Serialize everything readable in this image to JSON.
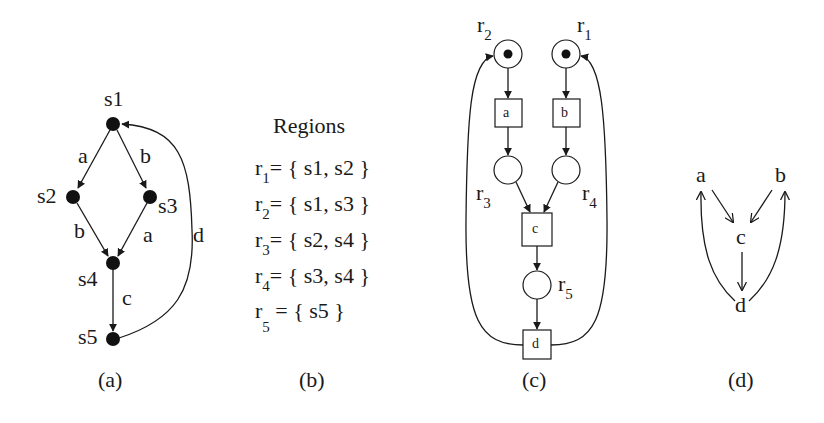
{
  "panel_a": {
    "caption": "(a)",
    "nodes": [
      {
        "id": "s1",
        "label": "s1"
      },
      {
        "id": "s2",
        "label": "s2"
      },
      {
        "id": "s3",
        "label": "s3"
      },
      {
        "id": "s4",
        "label": "s4"
      },
      {
        "id": "s5",
        "label": "s5"
      }
    ],
    "edges": [
      {
        "from": "s1",
        "to": "s2",
        "label": "a"
      },
      {
        "from": "s1",
        "to": "s3",
        "label": "b"
      },
      {
        "from": "s2",
        "to": "s4",
        "label": "b"
      },
      {
        "from": "s3",
        "to": "s4",
        "label": "a"
      },
      {
        "from": "s4",
        "to": "s5",
        "label": "c"
      },
      {
        "from": "s5",
        "to": "s1",
        "label": "d"
      }
    ]
  },
  "panel_b": {
    "caption": "(b)",
    "title": "Regions",
    "regions": [
      {
        "name": "r",
        "sub": "1",
        "set": "= { s1, s2 }"
      },
      {
        "name": "r",
        "sub": "2",
        "set": "= { s1, s3 }"
      },
      {
        "name": "r",
        "sub": "3",
        "set": "= { s2, s4 }"
      },
      {
        "name": "r",
        "sub": "4",
        "set": "= { s3, s4 }"
      },
      {
        "name": "r",
        "sub": "5",
        "set": " = { s5 }"
      }
    ]
  },
  "panel_c": {
    "caption": "(c)",
    "places": [
      {
        "id": "r2",
        "name": "r",
        "sub": "2",
        "token": true
      },
      {
        "id": "r1",
        "name": "r",
        "sub": "1",
        "token": true
      },
      {
        "id": "r3",
        "name": "r",
        "sub": "3",
        "token": false
      },
      {
        "id": "r4",
        "name": "r",
        "sub": "4",
        "token": false
      },
      {
        "id": "r5",
        "name": "r",
        "sub": "5",
        "token": false
      }
    ],
    "transitions": [
      {
        "id": "a",
        "label": "a"
      },
      {
        "id": "b",
        "label": "b"
      },
      {
        "id": "c",
        "label": "c"
      },
      {
        "id": "d",
        "label": "d"
      }
    ]
  },
  "panel_d": {
    "caption": "(d)",
    "nodes": [
      {
        "id": "a",
        "label": "a"
      },
      {
        "id": "b",
        "label": "b"
      },
      {
        "id": "c",
        "label": "c"
      },
      {
        "id": "d",
        "label": "d"
      }
    ],
    "edges": [
      {
        "from": "a",
        "to": "c"
      },
      {
        "from": "b",
        "to": "c"
      },
      {
        "from": "c",
        "to": "d"
      },
      {
        "from": "d",
        "to": "a"
      },
      {
        "from": "d",
        "to": "b"
      }
    ]
  }
}
